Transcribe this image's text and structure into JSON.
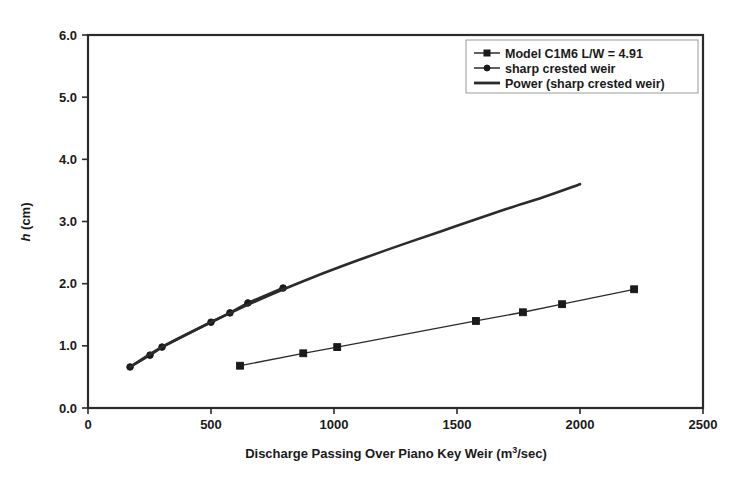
{
  "chart_data": {
    "type": "line",
    "title": "",
    "xlabel": "Discharge Passing Over Piano Key Weir (m3/sec)",
    "xlabel_main": "Discharge Passing Over Piano Key Weir (m",
    "xlabel_sup": "3",
    "xlabel_tail": "/sec)",
    "ylabel": "h (cm)",
    "ylabel_italic": "h",
    "ylabel_rest": " (cm)",
    "xlim": [
      0,
      2500
    ],
    "ylim": [
      0,
      6.0
    ],
    "xticks": [
      0,
      500,
      1000,
      1500,
      2000,
      2500
    ],
    "xticklabels": [
      "0",
      "500",
      "1000",
      "1500",
      "2000",
      "2500"
    ],
    "yticks": [
      0.0,
      1.0,
      2.0,
      3.0,
      4.0,
      5.0,
      6.0
    ],
    "yticklabels": [
      "0.0",
      "1.0",
      "2.0",
      "3.0",
      "4.0",
      "5.0",
      "6.0"
    ],
    "grid": false,
    "legend_position": "top-right",
    "series": [
      {
        "name": "Model C1M6 L/W = 4.91",
        "marker": "square",
        "line_width": "thin",
        "x": [
          618,
          875,
          1013,
          1577,
          1768,
          1927,
          2220
        ],
        "y": [
          0.68,
          0.88,
          0.98,
          1.4,
          1.54,
          1.67,
          1.91
        ]
      },
      {
        "name": "sharp crested weir",
        "marker": "circle",
        "line_width": "thick",
        "x": [
          171,
          252,
          301,
          500,
          577,
          650,
          793
        ],
        "y": [
          0.66,
          0.85,
          0.98,
          1.38,
          1.53,
          1.69,
          1.93
        ]
      },
      {
        "name": "Power (sharp crested weir)",
        "marker": "none",
        "line_width": "thick",
        "x": [
          171,
          300,
          500,
          700,
          900,
          1100,
          1300,
          1500,
          1700,
          1850,
          2000
        ],
        "y": [
          0.66,
          0.98,
          1.38,
          1.75,
          2.08,
          2.38,
          2.66,
          2.93,
          3.2,
          3.39,
          3.6
        ]
      }
    ]
  },
  "legend": {
    "entries": [
      {
        "label": "Model C1M6 L/W = 4.91",
        "marker": "square"
      },
      {
        "label": "sharp crested weir",
        "marker": "circle"
      },
      {
        "label": "Power (sharp crested weir)",
        "marker": "line"
      }
    ]
  },
  "colors": {
    "ink": "#1a1a1a",
    "frame": "#2b2b2b",
    "legend_border": "#9a9a9a",
    "background": "#ffffff"
  }
}
